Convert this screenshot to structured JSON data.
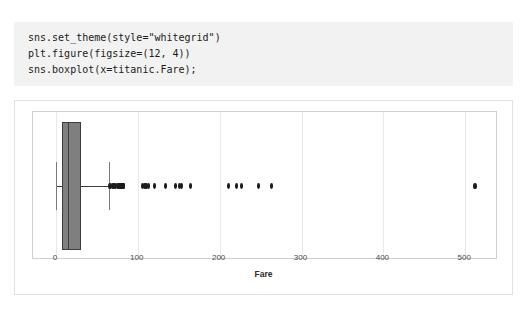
{
  "code_cell": {
    "name": "python-code-cell",
    "lines": [
      "sns.set_theme(style=\"whitegrid\")",
      "plt.figure(figsize=(12, 4))",
      "sns.boxplot(x=titanic.Fare);"
    ]
  },
  "chart_data": {
    "type": "boxplot",
    "title": "",
    "xlabel": "Fare",
    "ylabel": "",
    "orientation": "horizontal",
    "grid": true,
    "legend": null,
    "xlim": [
      -28,
      540
    ],
    "xticks": [
      0,
      100,
      200,
      300,
      400,
      500
    ],
    "xtick_labels": [
      "0",
      "100",
      "200",
      "300",
      "400",
      "500"
    ],
    "colors": {
      "box_face": "#7f7f7f",
      "box_edge": "#3d3d3d",
      "median": "#3d3d3d",
      "whisker": "#3d3d3d",
      "flier": "#1c1c1c",
      "grid": "#e8e8e8",
      "axes_edge": "#cfcfcf",
      "code_background": "#f2f2f2"
    },
    "box": {
      "q1": 7.91,
      "median": 14.45,
      "q3": 31.0,
      "whisker_low": 0.0,
      "whisker_high": 65.0
    },
    "outliers": [
      66,
      69,
      71,
      73,
      75,
      76,
      77,
      78,
      79,
      79,
      80,
      81,
      82,
      83,
      83,
      106,
      108,
      110,
      113,
      120,
      134,
      146,
      151,
      153,
      164,
      211,
      221,
      227,
      247,
      263,
      512
    ]
  }
}
